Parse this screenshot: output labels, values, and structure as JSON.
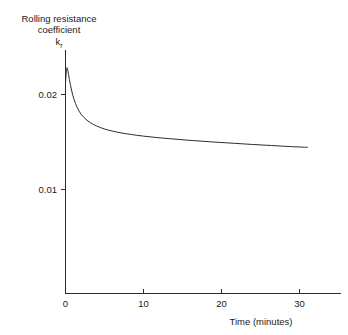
{
  "chart_data": {
    "type": "line",
    "title": "",
    "xlabel": "Time (minutes)",
    "ylabel_lines": [
      "Rolling resistance",
      "coefficient"
    ],
    "ylabel_symbol": "k",
    "ylabel_symbol_subscript": "r",
    "xlim": [
      0,
      32
    ],
    "ylim": [
      0,
      0.0255
    ],
    "xticks": [
      0,
      10,
      20,
      30
    ],
    "xtick_labels": [
      "0",
      "10",
      "20",
      "30"
    ],
    "yticks": [
      0.01,
      0.02
    ],
    "ytick_labels": [
      "0.01",
      "0.02"
    ],
    "grid": false,
    "legend": false,
    "series": [
      {
        "name": "Rolling resistance coefficient",
        "color": "#2b2b2b",
        "x": [
          0.0,
          0.15,
          0.3,
          0.5,
          0.8,
          1.1,
          1.5,
          2.0,
          2.6,
          3.2,
          4.0,
          5.0,
          6.0,
          7.2,
          8.5,
          10.0,
          11.7,
          13.5,
          15.4,
          17.4,
          19.5,
          21.7,
          24.0,
          26.4,
          28.8,
          31.0
        ],
        "y": [
          0.02121,
          0.02274,
          0.02253,
          0.02158,
          0.02037,
          0.01947,
          0.01863,
          0.01792,
          0.0174,
          0.01703,
          0.01668,
          0.01637,
          0.01615,
          0.01595,
          0.01578,
          0.01562,
          0.01547,
          0.01534,
          0.01521,
          0.01509,
          0.01497,
          0.01486,
          0.01474,
          0.01463,
          0.01452,
          0.01444
        ]
      }
    ],
    "annotations": {
      "peak_value": "0.0227",
      "final_value": "0.0144"
    }
  }
}
